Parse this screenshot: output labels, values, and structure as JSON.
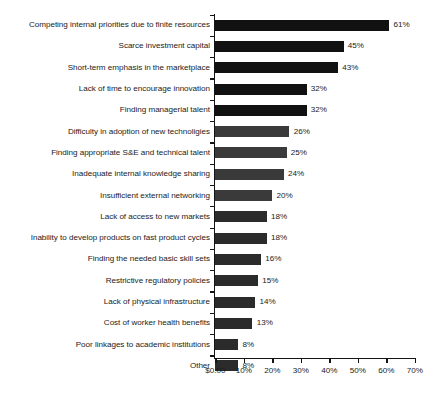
{
  "chart_data": {
    "type": "bar",
    "orientation": "horizontal",
    "title": "",
    "subtitle": "",
    "xlabel": "",
    "ylabel": "",
    "xlim": [
      0,
      70
    ],
    "grid": false,
    "legend": null,
    "bar_color": "#111111",
    "axis_color": "#141414",
    "text_color": "#1b1b1b",
    "x_tick_labels": [
      "$0.00",
      "10%",
      "20%",
      "30%",
      "40%",
      "50%",
      "60%",
      "70%"
    ],
    "x_tick_values": [
      0,
      10,
      20,
      30,
      40,
      50,
      60,
      70
    ],
    "categories": [
      "Competing internal priorities due to finite resources",
      "Scarce investment capital",
      "Short-term emphasis in the marketplace",
      "Lack of time to encourage innovation",
      "Finding managerial talent",
      "Difficulty in adoption of new technoligies",
      "Finding appropriate S&E and technical talent",
      "Inadequate internal knowledge sharing",
      "Insufficient external networking",
      "Lack of access to new markets",
      "Inability to develop products on fast product cycles",
      "Finding the needed basic skill sets",
      "Restrictive regulatory policies",
      "Lack of physical infrastructure",
      "Cost of worker health benefits",
      "Poor linkages to academic institutions",
      "Other"
    ],
    "values": [
      61,
      45,
      43,
      32,
      32,
      26,
      25,
      24,
      20,
      18,
      18,
      16,
      15,
      14,
      13,
      8,
      8
    ],
    "value_labels": [
      "61%",
      "45%",
      "43%",
      "32%",
      "32%",
      "26%",
      "25%",
      "24%",
      "20%",
      "18%",
      "18%",
      "16%",
      "15%",
      "14%",
      "13%",
      "8%",
      "8%"
    ]
  }
}
